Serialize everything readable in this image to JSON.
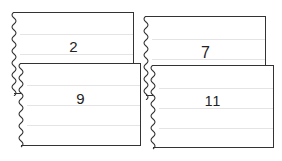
{
  "cards": [
    {
      "id": "a",
      "value": "2"
    },
    {
      "id": "b",
      "value": "9"
    },
    {
      "id": "c",
      "value": "7"
    },
    {
      "id": "d",
      "value": "11"
    }
  ]
}
